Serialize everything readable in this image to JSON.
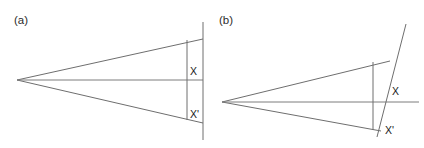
{
  "figure": {
    "background_color": "#ffffff",
    "line_color": "#6e6e6e",
    "text_color": "#1a1a1a",
    "width": 424,
    "height": 148
  },
  "panels": [
    {
      "id": "a",
      "label": "(a)",
      "label_pos": {
        "x": 14,
        "y": 24
      },
      "description": "cone of rays from a point source meeting a flat (vertical) screen",
      "apex": {
        "x": 17,
        "y": 80
      },
      "rays": [
        {
          "name": "upper-ray",
          "x1": 17,
          "y1": 80,
          "x2": 203,
          "y2": 39
        },
        {
          "name": "lower-ray",
          "x1": 17,
          "y1": 80,
          "x2": 203,
          "y2": 123
        }
      ],
      "axis": {
        "name": "optical-axis",
        "x1": 17,
        "y1": 80,
        "x2": 203,
        "y2": 80
      },
      "screen": {
        "name": "flat-screen",
        "x1": 203,
        "y1": 22,
        "x2": 203,
        "y2": 140,
        "tilted": false
      },
      "chord": {
        "name": "image-plane-chord",
        "x1": 187,
        "y1": 40,
        "x2": 187,
        "y2": 120
      },
      "labels": [
        {
          "text": "X",
          "x": 190,
          "y": 75
        },
        {
          "text": "X'",
          "x": 190,
          "y": 118
        }
      ]
    },
    {
      "id": "b",
      "label": "(b)",
      "label_pos": {
        "x": 219,
        "y": 24
      },
      "description": "cone of rays from a point source meeting a tilted screen",
      "apex": {
        "x": 222,
        "y": 102
      },
      "rays": [
        {
          "name": "upper-ray",
          "x1": 222,
          "y1": 102,
          "x2": 390,
          "y2": 61
        },
        {
          "name": "lower-ray",
          "x1": 222,
          "y1": 102,
          "x2": 381,
          "y2": 131
        }
      ],
      "axis": {
        "name": "optical-axis",
        "x1": 222,
        "y1": 102,
        "x2": 419,
        "y2": 102
      },
      "screen": {
        "name": "tilted-screen",
        "x1": 406,
        "y1": 24,
        "x2": 377,
        "y2": 137,
        "tilted": true
      },
      "chord": {
        "name": "image-plane-chord",
        "x1": 373,
        "y1": 62,
        "x2": 373,
        "y2": 130
      },
      "labels": [
        {
          "text": "X",
          "x": 392,
          "y": 95
        },
        {
          "text": "X'",
          "x": 385,
          "y": 134
        }
      ]
    }
  ],
  "symbols": {
    "X": "X",
    "X_prime": "X'"
  }
}
